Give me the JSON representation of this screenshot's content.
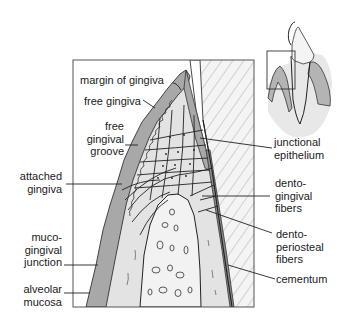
{
  "figure": {
    "type": "anatomical-diagram",
    "colors": {
      "background": "#ffffff",
      "gingiva_dark": "#a9a9a9",
      "gingiva_light": "#dcdcdc",
      "bone": "#eeeeee",
      "tooth_hatch": "#f2f2f2",
      "line": "#222222"
    }
  },
  "labels_left": [
    {
      "id": "margin-of-gingiva",
      "lines": [
        "margin of gingiva"
      ]
    },
    {
      "id": "free-gingiva",
      "lines": [
        "free gingiva"
      ]
    },
    {
      "id": "free-gingival-groove",
      "lines": [
        "free",
        "gingival",
        "groove"
      ]
    },
    {
      "id": "attached-gingiva",
      "lines": [
        "attached",
        "gingiva"
      ]
    },
    {
      "id": "mucogingival-junction",
      "lines": [
        "muco-",
        "gingival",
        "junction"
      ]
    },
    {
      "id": "alveolar-mucosa",
      "lines": [
        "alveolar",
        "mucosa"
      ]
    }
  ],
  "labels_right": [
    {
      "id": "junctional-epithelium",
      "lines": [
        "junctional",
        "epithelium"
      ]
    },
    {
      "id": "dentogingival-fibers",
      "lines": [
        "dento-",
        "gingival",
        "fibers"
      ]
    },
    {
      "id": "dentoperiosteal-fibers",
      "lines": [
        "dento-",
        "periosteal",
        "fibers"
      ]
    },
    {
      "id": "cementum",
      "lines": [
        "cementum"
      ]
    }
  ],
  "inset": {
    "description": "tooth overview with highlighted region box"
  }
}
